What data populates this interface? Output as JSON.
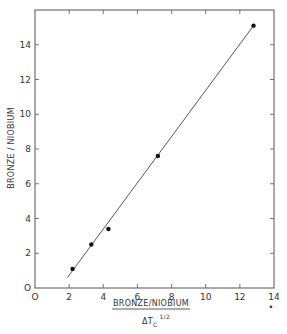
{
  "chart_data": {
    "type": "scatter",
    "title": "",
    "xlabel": "BRONZE/NIOBIUM / ΔT_C^(1/2)",
    "xlabel_numerator": "BRONZE/NIOBIUM",
    "xlabel_denominator_base": "ΔT",
    "xlabel_denominator_sub": "C",
    "xlabel_denominator_sup": "1/2",
    "ylabel": "BRONZE / NIOBIUM",
    "xlim": [
      0,
      14
    ],
    "ylim": [
      0,
      16
    ],
    "xticks": [
      0,
      2,
      4,
      6,
      8,
      10,
      12,
      14
    ],
    "xtick_labels": [
      "O",
      "2",
      "4",
      "6",
      "8",
      "10",
      "12",
      "14"
    ],
    "yticks": [
      0,
      2,
      4,
      6,
      8,
      10,
      12,
      14
    ],
    "ytick_labels": [
      "O",
      "2",
      "4",
      "6",
      "8",
      "10",
      "12",
      "14"
    ],
    "grid": false,
    "legend": null,
    "series": [
      {
        "name": "data",
        "marker": "filled-circle",
        "x": [
          2.2,
          3.3,
          4.3,
          7.2,
          12.8
        ],
        "y": [
          1.1,
          2.5,
          3.4,
          7.6,
          15.1
        ]
      },
      {
        "name": "fit-line",
        "style": "line",
        "x": [
          1.9,
          12.8
        ],
        "y": [
          0.6,
          15.1
        ]
      }
    ],
    "annotations": [
      "•"
    ]
  }
}
